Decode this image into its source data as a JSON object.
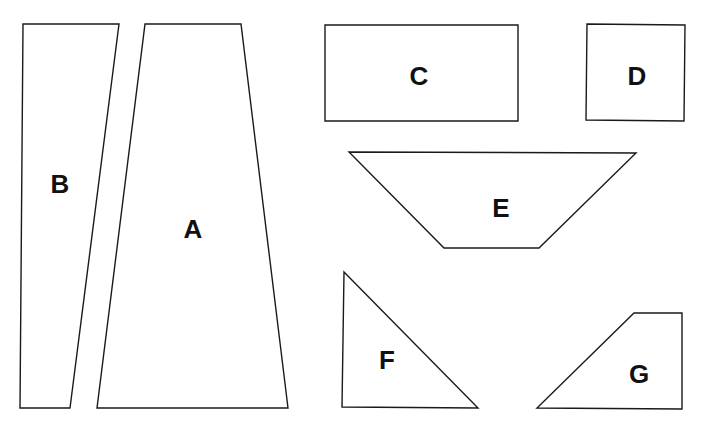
{
  "diagram": {
    "stroke_color": "#1a1a1a",
    "background": "#ffffff",
    "shapes": [
      {
        "id": "A",
        "label": "A",
        "type": "trapezoid",
        "points": "145,24 241,24 288,408 97,408",
        "label_pos": [
          193,
          229
        ]
      },
      {
        "id": "B",
        "label": "B",
        "type": "trapezoid",
        "points": "23,24 119,24 70,408 20,408",
        "label_pos": [
          60,
          184
        ]
      },
      {
        "id": "C",
        "label": "C",
        "type": "rectangle",
        "points": "325,25 518,25 518,121 325,121",
        "label_pos": [
          419,
          76
        ]
      },
      {
        "id": "D",
        "label": "D",
        "type": "square",
        "points": "587,24 685,25 684,121 586,120",
        "label_pos": [
          637,
          76
        ]
      },
      {
        "id": "E",
        "label": "E",
        "type": "trapezoid",
        "points": "349,152 636,153 539,248 444,248",
        "label_pos": [
          501,
          208
        ]
      },
      {
        "id": "F",
        "label": "F",
        "type": "right-triangle",
        "points": "344,272 478,408 342,407",
        "label_pos": [
          387,
          360
        ]
      },
      {
        "id": "G",
        "label": "G",
        "type": "quadrilateral",
        "points": "634,313 682,313 682,409 537,408",
        "label_pos": [
          639,
          374
        ]
      }
    ]
  }
}
